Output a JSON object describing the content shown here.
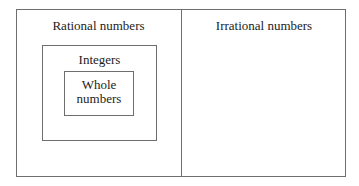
{
  "diagram": {
    "title": "",
    "sets": {
      "rational": {
        "label": "Rational numbers"
      },
      "irrational": {
        "label": "Irrational numbers"
      },
      "integers": {
        "label": "Integers"
      },
      "whole": {
        "label_line1": "Whole",
        "label_line2": "numbers"
      }
    },
    "relations": [
      "Whole numbers ⊂ Integers",
      "Integers ⊂ Rational numbers",
      "Rational numbers and Irrational numbers are disjoint"
    ],
    "colors": {
      "border": "#6e6e6e",
      "text": "#222222",
      "background": "#ffffff"
    }
  }
}
